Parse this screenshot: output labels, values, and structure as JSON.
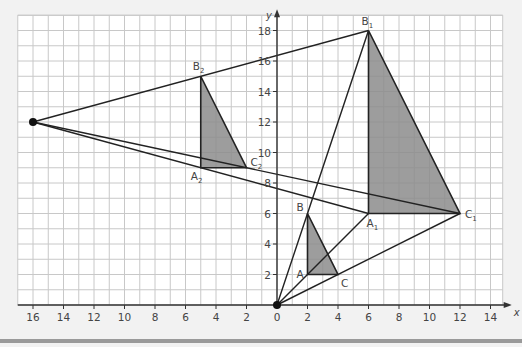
{
  "chart_data": {
    "type": "diagram",
    "xlabel": "x",
    "ylabel": "y",
    "xlim": [
      -17,
      14.8
    ],
    "ylim": [
      0,
      19
    ],
    "grid": true,
    "x_ticks": [
      -16,
      -14,
      -12,
      -10,
      -8,
      -6,
      -4,
      -2,
      0,
      2,
      4,
      6,
      8,
      10,
      12,
      14
    ],
    "x_tick_labels": [
      "16",
      "14",
      "12",
      "10",
      "8",
      "6",
      "4",
      "2",
      "0",
      "2",
      "4",
      "6",
      "8",
      "10",
      "12",
      "14"
    ],
    "y_ticks": [
      2,
      4,
      6,
      8,
      10,
      12,
      14,
      16,
      18
    ],
    "y_tick_labels": [
      "2",
      "4",
      "6",
      "8",
      "10",
      "12",
      "14",
      "16",
      "18"
    ],
    "centres": [
      {
        "name": "origin",
        "x": 0,
        "y": 0
      },
      {
        "name": "centre-2",
        "x": -16,
        "y": 12
      }
    ],
    "triangles": [
      {
        "name": "ABC",
        "shaded": true,
        "points": [
          {
            "label": "A",
            "x": 2,
            "y": 2
          },
          {
            "label": "B",
            "x": 2,
            "y": 6
          },
          {
            "label": "C",
            "x": 4,
            "y": 2
          }
        ]
      },
      {
        "name": "A1B1C1",
        "shaded": true,
        "points": [
          {
            "label": "A1",
            "x": 6,
            "y": 6
          },
          {
            "label": "B1",
            "x": 6,
            "y": 18
          },
          {
            "label": "C1",
            "x": 12,
            "y": 6
          }
        ]
      },
      {
        "name": "A2B2C2",
        "shaded": true,
        "points": [
          {
            "label": "A2",
            "x": -5,
            "y": 9
          },
          {
            "label": "B2",
            "x": -5,
            "y": 15
          },
          {
            "label": "C2",
            "x": -2,
            "y": 9
          }
        ]
      }
    ],
    "rays": [
      {
        "from": [
          0,
          0
        ],
        "to": [
          6,
          18
        ]
      },
      {
        "from": [
          0,
          0
        ],
        "to": [
          6,
          6
        ]
      },
      {
        "from": [
          0,
          0
        ],
        "to": [
          12,
          6
        ]
      },
      {
        "from": [
          -16,
          12
        ],
        "to": [
          6,
          18
        ]
      },
      {
        "from": [
          -16,
          12
        ],
        "to": [
          6,
          6
        ]
      },
      {
        "from": [
          -16,
          12
        ],
        "to": [
          12,
          6
        ]
      }
    ]
  },
  "colors": {
    "background": "#f2f2f2",
    "grid_bg": "#ffffff",
    "grid_line": "#c8c8c8",
    "axis": "#333333",
    "shade": "#8c8c8c",
    "line": "#222222",
    "bottom_bar": "#9a9a9a"
  }
}
